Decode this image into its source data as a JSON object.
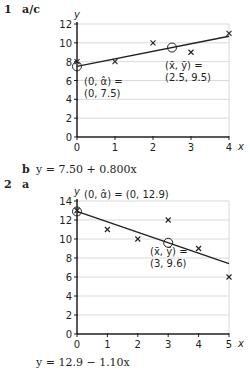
{
  "q1": {
    "number": "1",
    "part_ac": "a/c",
    "part_b": "b",
    "answer_b": "y = 7.50 + 0.800x"
  },
  "q2": {
    "number": "2",
    "part_a": "a",
    "answer": "y = 12.9 − 1.10x"
  },
  "chart_data": [
    {
      "type": "scatter",
      "title": "",
      "xlabel": "x",
      "ylabel": "y",
      "xlim": [
        0,
        4
      ],
      "ylim": [
        0,
        12
      ],
      "x_ticks": [
        "0",
        "1",
        "2",
        "3",
        "4"
      ],
      "y_ticks": [
        "0",
        "2",
        "4",
        "6",
        "8",
        "10",
        "12"
      ],
      "grid": "horizontal",
      "series": [
        {
          "name": "data",
          "marker": "x",
          "x": [
            0,
            1,
            2,
            3,
            4
          ],
          "y": [
            8,
            8,
            10,
            9,
            11
          ]
        }
      ],
      "regression_line": {
        "intercept": 7.5,
        "slope": 0.8,
        "x_range": [
          0,
          4
        ]
      },
      "highlighted_points": [
        {
          "x": 0,
          "y": 7.5,
          "label_line1": "(0, α̂) =",
          "label_line2": "(0, 7.5)"
        },
        {
          "x": 2.5,
          "y": 9.5,
          "label_line1": "(x̄, ȳ) =",
          "label_line2": "(2.5, 9.5)"
        }
      ]
    },
    {
      "type": "scatter",
      "title": "",
      "xlabel": "x",
      "ylabel": "y",
      "xlim": [
        0,
        5
      ],
      "ylim": [
        0,
        14
      ],
      "x_ticks": [
        "0",
        "1",
        "2",
        "3",
        "4",
        "5"
      ],
      "y_ticks": [
        "0",
        "2",
        "4",
        "6",
        "8",
        "10",
        "12",
        "14"
      ],
      "grid": "horizontal",
      "series": [
        {
          "name": "data",
          "marker": "x",
          "x": [
            0,
            1,
            2,
            3,
            4,
            5
          ],
          "y": [
            13,
            11,
            10,
            12,
            9,
            6
          ]
        }
      ],
      "regression_line": {
        "intercept": 12.9,
        "slope": -1.1,
        "x_range": [
          0,
          5
        ]
      },
      "highlighted_points": [
        {
          "x": 0,
          "y": 12.9,
          "label_line1": "(0, α̂) = (0, 12.9)",
          "label_line2": ""
        },
        {
          "x": 3,
          "y": 9.6,
          "label_line1": "(x̄, ȳ) =",
          "label_line2": "(3, 9.6)"
        }
      ]
    }
  ]
}
